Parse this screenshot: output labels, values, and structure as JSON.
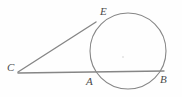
{
  "figure": {
    "kind": "geometry-diagram",
    "width": 182,
    "height": 97,
    "background_color": "#fefefe",
    "stroke_color": "#868686",
    "label_color": "#4a4a4a"
  },
  "labels": {
    "E": "E",
    "C": "C",
    "A": "A",
    "B": "B"
  },
  "label_positions": {
    "E": {
      "x": 100,
      "y": 6
    },
    "C": {
      "x": 7,
      "y": 62
    },
    "A": {
      "x": 86,
      "y": 76
    },
    "B": {
      "x": 160,
      "y": 74
    }
  },
  "chart_data": {
    "type": "diagram",
    "title": "",
    "circle": {
      "center_x": 128,
      "center_y": 51,
      "radius": 38,
      "stroke": "#868686",
      "stroke_width": 1.1,
      "fill": "none"
    },
    "center_dot": {
      "x": 123,
      "y": 57,
      "radius": 0.8,
      "color": "#cfcfcf"
    },
    "points": [
      {
        "name": "C",
        "x": 18,
        "y": 72,
        "role": "external-point"
      },
      {
        "name": "E",
        "x": 96,
        "y": 22,
        "role": "tangent-point"
      },
      {
        "name": "A",
        "x": 91,
        "y": 72,
        "role": "secant-near-intersection"
      },
      {
        "name": "B",
        "x": 164,
        "y": 71,
        "role": "secant-far-intersection"
      }
    ],
    "segments": [
      {
        "name": "CE",
        "from": "C",
        "to": "E",
        "x1": 18,
        "y1": 72,
        "x2": 96,
        "y2": 22,
        "role": "tangent-line",
        "stroke": "#868686",
        "stroke_width": 1.4
      },
      {
        "name": "CB",
        "from": "C",
        "to": "B",
        "x1": 18,
        "y1": 73,
        "x2": 164,
        "y2": 71,
        "role": "secant-line",
        "stroke": "#868686",
        "stroke_width": 1.4
      }
    ]
  }
}
